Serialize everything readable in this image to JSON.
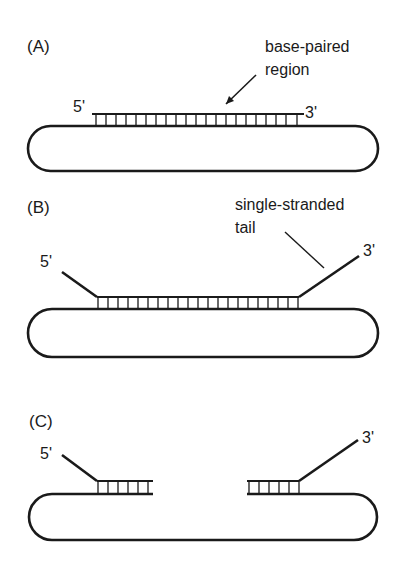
{
  "panels": [
    {
      "id": "A",
      "label": "(A)",
      "five_prime": "5'",
      "three_prime": "3'",
      "annotation_line1": "base-paired",
      "annotation_line2": "region"
    },
    {
      "id": "B",
      "label": "(B)",
      "five_prime": "5'",
      "three_prime": "3'",
      "annotation_line1": "single-stranded",
      "annotation_line2": "tail"
    },
    {
      "id": "C",
      "label": "(C)",
      "five_prime": "5'",
      "three_prime": "3'"
    }
  ],
  "colors": {
    "stroke": "#1a1a1a",
    "background": "#ffffff"
  }
}
